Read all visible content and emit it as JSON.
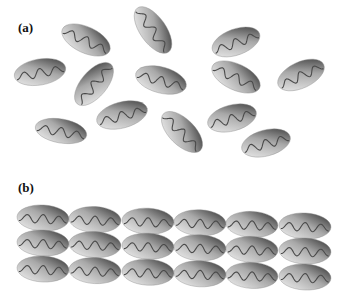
{
  "panels": {
    "a": {
      "label": "(a)",
      "description": "Randomly oriented ellipsoidal molecules (disordered)",
      "molecules": [
        {
          "cx": 86,
          "cy": 40,
          "rx": 26,
          "ry": 13,
          "angle": 25
        },
        {
          "cx": 153,
          "cy": 30,
          "rx": 27,
          "ry": 13,
          "angle": 55
        },
        {
          "cx": 236,
          "cy": 42,
          "rx": 25,
          "ry": 13,
          "angle": -20
        },
        {
          "cx": 40,
          "cy": 72,
          "rx": 26,
          "ry": 13,
          "angle": -10
        },
        {
          "cx": 94,
          "cy": 84,
          "rx": 26,
          "ry": 13,
          "angle": -50
        },
        {
          "cx": 161,
          "cy": 80,
          "rx": 26,
          "ry": 13,
          "angle": 15
        },
        {
          "cx": 236,
          "cy": 77,
          "rx": 26,
          "ry": 13,
          "angle": 25
        },
        {
          "cx": 301,
          "cy": 75,
          "rx": 25,
          "ry": 13,
          "angle": -25
        },
        {
          "cx": 61,
          "cy": 131,
          "rx": 26,
          "ry": 12,
          "angle": 10
        },
        {
          "cx": 122,
          "cy": 115,
          "rx": 26,
          "ry": 13,
          "angle": -15
        },
        {
          "cx": 182,
          "cy": 132,
          "rx": 26,
          "ry": 13,
          "angle": 45
        },
        {
          "cx": 232,
          "cy": 118,
          "rx": 25,
          "ry": 13,
          "angle": -15
        },
        {
          "cx": 266,
          "cy": 143,
          "rx": 25,
          "ry": 13,
          "angle": -15
        }
      ]
    },
    "b": {
      "label": "(b)",
      "description": "Aligned ellipsoidal molecules in a 3 x 6 ordered array",
      "rows": 3,
      "cols": 6,
      "row_y": [
        218,
        243,
        269
      ],
      "col_x": [
        43,
        95,
        148,
        200,
        252,
        305
      ],
      "row_drop_per_col": 1.6,
      "rx": 26,
      "ry": 13,
      "angle": 3
    }
  },
  "colors": {
    "fill_light": "#f2f2f2",
    "fill_mid": "#a8a8a8",
    "fill_dark": "#2e2e2e",
    "wave": "#4a4a4a",
    "background": "#ffffff"
  }
}
